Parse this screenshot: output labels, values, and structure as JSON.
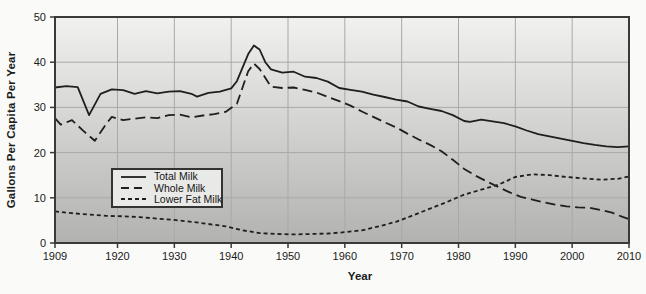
{
  "figure": {
    "y_axis_title": "Gallons Per Capita Per Year",
    "x_axis_title": "Year"
  },
  "colors": {
    "line": "#1f1f1d",
    "plot_bg_top": "#f1f1ef",
    "plot_bg_bottom": "#b2b2b0",
    "grid": "#a9a9a7",
    "border": "#3a3a38",
    "tick_text": "#1b1b1b",
    "page_bg": "#fafaf8",
    "legend_bg": "#e9e9e7"
  },
  "chart_data": {
    "type": "line",
    "title": "",
    "xlabel": "Year",
    "ylabel": "Gallons Per Capita Per Year",
    "xlim": [
      1909,
      2010
    ],
    "ylim": [
      0,
      50
    ],
    "x_ticks": [
      1909,
      1920,
      1930,
      1940,
      1950,
      1960,
      1970,
      1980,
      1990,
      2000,
      2010
    ],
    "y_ticks": [
      0,
      10,
      20,
      30,
      40,
      50
    ],
    "grid": true,
    "legend_position": "inside-lower-left",
    "series": [
      {
        "name": "Total Milk",
        "style": "solid",
        "points": [
          [
            1909,
            34.4
          ],
          [
            1911,
            34.7
          ],
          [
            1913,
            34.5
          ],
          [
            1915,
            28.3
          ],
          [
            1917,
            33.0
          ],
          [
            1919,
            34.0
          ],
          [
            1921,
            33.8
          ],
          [
            1923,
            33.0
          ],
          [
            1925,
            33.6
          ],
          [
            1927,
            33.1
          ],
          [
            1929,
            33.5
          ],
          [
            1931,
            33.6
          ],
          [
            1933,
            33.0
          ],
          [
            1934,
            32.4
          ],
          [
            1936,
            33.2
          ],
          [
            1938,
            33.5
          ],
          [
            1940,
            34.2
          ],
          [
            1941,
            35.8
          ],
          [
            1943,
            41.8
          ],
          [
            1944,
            43.7
          ],
          [
            1945,
            42.8
          ],
          [
            1946,
            40.0
          ],
          [
            1947,
            38.4
          ],
          [
            1949,
            37.7
          ],
          [
            1951,
            37.9
          ],
          [
            1953,
            36.8
          ],
          [
            1955,
            36.5
          ],
          [
            1957,
            35.7
          ],
          [
            1959,
            34.3
          ],
          [
            1961,
            33.9
          ],
          [
            1963,
            33.5
          ],
          [
            1965,
            32.8
          ],
          [
            1967,
            32.3
          ],
          [
            1969,
            31.7
          ],
          [
            1971,
            31.3
          ],
          [
            1973,
            30.2
          ],
          [
            1975,
            29.7
          ],
          [
            1977,
            29.2
          ],
          [
            1979,
            28.3
          ],
          [
            1981,
            27.0
          ],
          [
            1982,
            26.8
          ],
          [
            1984,
            27.3
          ],
          [
            1986,
            26.9
          ],
          [
            1988,
            26.5
          ],
          [
            1990,
            25.8
          ],
          [
            1992,
            24.9
          ],
          [
            1994,
            24.1
          ],
          [
            1996,
            23.6
          ],
          [
            1998,
            23.1
          ],
          [
            2000,
            22.6
          ],
          [
            2002,
            22.1
          ],
          [
            2004,
            21.7
          ],
          [
            2006,
            21.4
          ],
          [
            2008,
            21.2
          ],
          [
            2010,
            21.4
          ]
        ]
      },
      {
        "name": "Whole Milk",
        "style": "long-dash",
        "points": [
          [
            1909,
            27.6
          ],
          [
            1910,
            26.2
          ],
          [
            1912,
            27.2
          ],
          [
            1914,
            24.8
          ],
          [
            1916,
            22.6
          ],
          [
            1918,
            26.3
          ],
          [
            1919,
            27.9
          ],
          [
            1921,
            27.2
          ],
          [
            1923,
            27.5
          ],
          [
            1925,
            27.8
          ],
          [
            1927,
            27.6
          ],
          [
            1929,
            28.3
          ],
          [
            1931,
            28.4
          ],
          [
            1933,
            27.8
          ],
          [
            1935,
            28.2
          ],
          [
            1937,
            28.5
          ],
          [
            1939,
            29.0
          ],
          [
            1941,
            30.8
          ],
          [
            1943,
            38.0
          ],
          [
            1944,
            39.7
          ],
          [
            1945,
            38.5
          ],
          [
            1947,
            34.6
          ],
          [
            1949,
            34.3
          ],
          [
            1951,
            34.4
          ],
          [
            1953,
            33.9
          ],
          [
            1955,
            33.3
          ],
          [
            1957,
            32.3
          ],
          [
            1959,
            31.4
          ],
          [
            1961,
            30.4
          ],
          [
            1963,
            29.1
          ],
          [
            1965,
            27.9
          ],
          [
            1967,
            26.7
          ],
          [
            1969,
            25.6
          ],
          [
            1971,
            24.2
          ],
          [
            1973,
            22.9
          ],
          [
            1975,
            21.7
          ],
          [
            1977,
            20.3
          ],
          [
            1979,
            18.4
          ],
          [
            1981,
            16.4
          ],
          [
            1983,
            14.9
          ],
          [
            1985,
            13.6
          ],
          [
            1987,
            12.4
          ],
          [
            1989,
            11.2
          ],
          [
            1991,
            10.2
          ],
          [
            1993,
            9.6
          ],
          [
            1995,
            9.0
          ],
          [
            1997,
            8.5
          ],
          [
            1999,
            8.1
          ],
          [
            2001,
            7.9
          ],
          [
            2003,
            7.8
          ],
          [
            2005,
            7.3
          ],
          [
            2007,
            6.7
          ],
          [
            2009,
            5.7
          ],
          [
            2010,
            5.3
          ]
        ]
      },
      {
        "name": "Lower Fat Milk",
        "style": "short-dash",
        "points": [
          [
            1909,
            7.0
          ],
          [
            1912,
            6.6
          ],
          [
            1915,
            6.3
          ],
          [
            1918,
            6.0
          ],
          [
            1921,
            5.9
          ],
          [
            1924,
            5.7
          ],
          [
            1927,
            5.4
          ],
          [
            1930,
            5.1
          ],
          [
            1933,
            4.7
          ],
          [
            1936,
            4.2
          ],
          [
            1939,
            3.7
          ],
          [
            1942,
            2.8
          ],
          [
            1945,
            2.2
          ],
          [
            1948,
            2.0
          ],
          [
            1951,
            1.9
          ],
          [
            1954,
            2.0
          ],
          [
            1957,
            2.1
          ],
          [
            1960,
            2.4
          ],
          [
            1963,
            2.8
          ],
          [
            1966,
            3.7
          ],
          [
            1969,
            4.7
          ],
          [
            1972,
            6.1
          ],
          [
            1975,
            7.6
          ],
          [
            1978,
            9.1
          ],
          [
            1981,
            10.7
          ],
          [
            1984,
            11.8
          ],
          [
            1987,
            12.9
          ],
          [
            1990,
            14.6
          ],
          [
            1993,
            15.2
          ],
          [
            1996,
            15.0
          ],
          [
            1999,
            14.6
          ],
          [
            2002,
            14.3
          ],
          [
            2005,
            14.0
          ],
          [
            2008,
            14.2
          ],
          [
            2010,
            14.7
          ]
        ]
      }
    ]
  }
}
